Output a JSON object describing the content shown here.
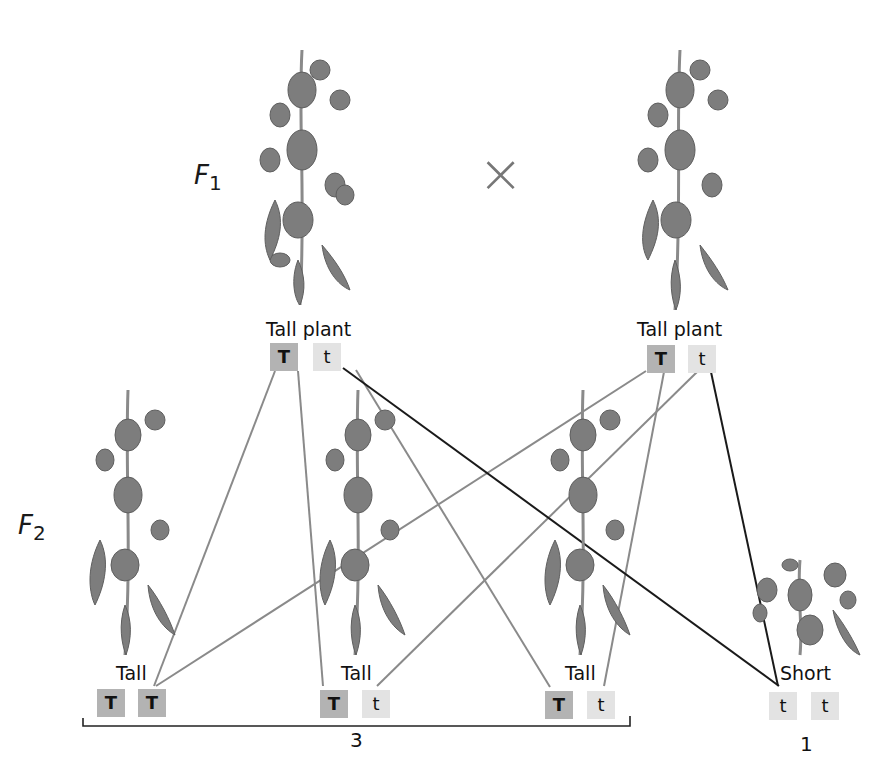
{
  "generations": {
    "f1": {
      "letter": "F",
      "sub": "1"
    },
    "f2": {
      "letter": "F",
      "sub": "2"
    }
  },
  "cross_symbol": "×",
  "parents": [
    {
      "label": "Tall plant",
      "alleles": [
        "T",
        "t"
      ]
    },
    {
      "label": "Tall plant",
      "alleles": [
        "T",
        "t"
      ]
    }
  ],
  "offspring": [
    {
      "label": "Tall",
      "alleles": [
        "T",
        "T"
      ]
    },
    {
      "label": "Tall",
      "alleles": [
        "T",
        "t"
      ]
    },
    {
      "label": "Tall",
      "alleles": [
        "T",
        "t"
      ]
    },
    {
      "label": "Short",
      "alleles": [
        "t",
        "t"
      ]
    }
  ],
  "ratio": {
    "tall_count": "3",
    "short_count": "1"
  },
  "colors": {
    "dominant_box": "#b3b3b3",
    "recessive_box": "#e3e3e3",
    "line_gray": "#8a8a8a",
    "line_dark": "#1a1a1a"
  }
}
